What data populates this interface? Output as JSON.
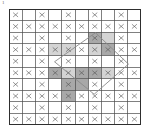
{
  "figure": {
    "corner_label": "1",
    "background_color": "#ffffff",
    "grid_line_color": "#4a4a4a",
    "grid_border_color": "#2e2e2e",
    "xmark_color": "#555555",
    "polygon_stroke_color": "#8a8a8a",
    "shade_light_color": "#d4d4d4",
    "shade_dark_color": "#a8a8a8"
  },
  "chart_data": {
    "type": "heatmap",
    "title": "",
    "subtitle": "",
    "xlabel": "",
    "ylabel": "",
    "grid": true,
    "legend": "none",
    "columns": 10,
    "rows": 10,
    "x": [
      1,
      2,
      3,
      4,
      5,
      6,
      7,
      8,
      9,
      10
    ],
    "y": [
      1,
      2,
      3,
      4,
      5,
      6,
      7,
      8,
      9,
      10
    ],
    "xlim": [
      0,
      10
    ],
    "ylim": [
      0,
      10
    ],
    "tick_labels_x": [],
    "tick_labels_y": [],
    "annotations": [],
    "cell_marker_glyph": "x",
    "marker_rows": [
      {
        "row": 1,
        "marked_columns": [
          1,
          3,
          5,
          7,
          9
        ]
      },
      {
        "row": 2,
        "marked_columns": [
          1,
          2,
          3,
          4,
          5,
          6,
          7,
          8,
          9,
          10
        ]
      },
      {
        "row": 3,
        "marked_columns": [
          1,
          3,
          5,
          7,
          9
        ]
      },
      {
        "row": 4,
        "marked_columns": [
          1,
          2,
          3,
          4,
          5,
          6,
          7,
          8,
          9,
          10
        ]
      },
      {
        "row": 5,
        "marked_columns": [
          1,
          3,
          5,
          7,
          9
        ]
      },
      {
        "row": 6,
        "marked_columns": [
          1,
          2,
          3,
          4,
          5,
          6,
          7,
          8,
          9,
          10
        ]
      },
      {
        "row": 7,
        "marked_columns": [
          1,
          3,
          5,
          7,
          9
        ]
      },
      {
        "row": 8,
        "marked_columns": [
          1,
          2,
          3,
          4,
          5,
          6,
          7,
          8,
          9,
          10
        ]
      },
      {
        "row": 9,
        "marked_columns": [
          1,
          3,
          5,
          7,
          9
        ]
      },
      {
        "row": 10,
        "marked_columns": [
          1,
          2,
          3,
          4,
          5,
          6,
          7,
          8,
          9,
          10
        ]
      }
    ],
    "shaded_cells": [
      {
        "row": 3,
        "col": 7,
        "shade": "dark"
      },
      {
        "row": 3,
        "col": 8,
        "shade": "light"
      },
      {
        "row": 4,
        "col": 4,
        "shade": "light"
      },
      {
        "row": 4,
        "col": 5,
        "shade": "light"
      },
      {
        "row": 4,
        "col": 7,
        "shade": "light"
      },
      {
        "row": 4,
        "col": 8,
        "shade": "dark"
      },
      {
        "row": 6,
        "col": 4,
        "shade": "dark"
      },
      {
        "row": 6,
        "col": 5,
        "shade": "light"
      },
      {
        "row": 6,
        "col": 6,
        "shade": "dark"
      },
      {
        "row": 6,
        "col": 7,
        "shade": "dark"
      },
      {
        "row": 6,
        "col": 8,
        "shade": "light"
      },
      {
        "row": 7,
        "col": 5,
        "shade": "dark"
      },
      {
        "row": 7,
        "col": 6,
        "shade": "dark"
      },
      {
        "row": 8,
        "col": 5,
        "shade": "dark"
      }
    ],
    "polygon": {
      "name": "rotated-square",
      "closed": true,
      "vertices": [
        {
          "x": 6.55,
          "y": 2.05
        },
        {
          "x": 9.05,
          "y": 4.75
        },
        {
          "x": 6.45,
          "y": 7.35
        },
        {
          "x": 3.45,
          "y": 4.55
        }
      ]
    }
  }
}
